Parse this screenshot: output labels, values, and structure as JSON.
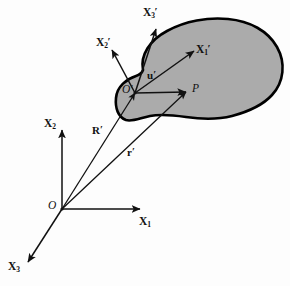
{
  "figure": {
    "background_color": "#fdfdfd",
    "body": {
      "name": "deformable-body",
      "fill_color": "#ababab",
      "stroke_color": "#000000"
    }
  },
  "global_frame": {
    "origin_label": "O",
    "axes": [
      {
        "name": "x1",
        "label": "X",
        "subscript": "1",
        "prime": ""
      },
      {
        "name": "x2",
        "label": "X",
        "subscript": "2",
        "prime": ""
      },
      {
        "name": "x3",
        "label": "X",
        "subscript": "3",
        "prime": ""
      }
    ]
  },
  "body_frame": {
    "origin_label": "O",
    "origin_prime": "′",
    "axes": [
      {
        "name": "x1-prime",
        "label": "X",
        "subscript": "1",
        "prime": "′"
      },
      {
        "name": "x2-prime",
        "label": "X",
        "subscript": "2",
        "prime": "′"
      },
      {
        "name": "x3-prime",
        "label": "X",
        "subscript": "3",
        "prime": "′"
      }
    ]
  },
  "point": {
    "label": "P"
  },
  "vectors": [
    {
      "name": "position-vector-R-prime",
      "label": "R",
      "prime": "′",
      "from": "O",
      "to": "O′"
    },
    {
      "name": "position-vector-r-prime",
      "label": "r",
      "prime": "′",
      "from": "O",
      "to": "P"
    },
    {
      "name": "relative-vector-u-prime",
      "label": "u",
      "prime": "′",
      "from": "O′",
      "to": "P"
    }
  ]
}
